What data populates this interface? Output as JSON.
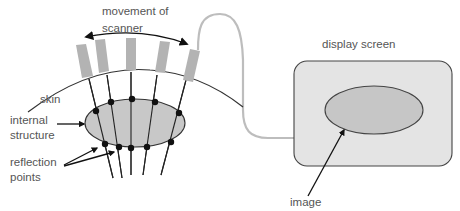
{
  "labels": {
    "movement_line1": "movement of",
    "movement_line2": "scanner",
    "skin": "skin",
    "internal_line1": "internal",
    "internal_line2": "structure",
    "reflection_line1": "reflection",
    "reflection_line2": "points",
    "display_screen": "display screen",
    "image": "image"
  },
  "colors": {
    "probe_fill": "#b3b3b3",
    "structure_fill": "#c8c8c8",
    "screen_fill": "#e4e4e4",
    "image_fill": "#c6c6c6",
    "cable": "#bdbdbd",
    "line": "#222222",
    "text": "#555555"
  },
  "diagram": {
    "probe_count": 5,
    "reflection_point_count": 10
  }
}
